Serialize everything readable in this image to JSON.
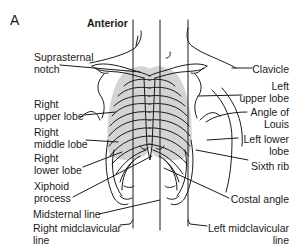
{
  "figure": {
    "panel_letter": "A",
    "view_title": "Anterior",
    "colors": {
      "line": "#1a1a1a",
      "lung_fill": "#d4d4d4",
      "background": "#ffffff"
    }
  },
  "labels_left": [
    {
      "id": "suprasternal-notch",
      "line1": "Suprasternal",
      "line2": "notch"
    },
    {
      "id": "right-upper-lobe",
      "line1": "Right",
      "line2": "upper lobe"
    },
    {
      "id": "right-middle-lobe",
      "line1": "Right",
      "line2": "middle lobe"
    },
    {
      "id": "right-lower-lobe",
      "line1": "Right",
      "line2": "lower lobe"
    },
    {
      "id": "xiphoid-process",
      "line1": "Xiphoid",
      "line2": "process"
    },
    {
      "id": "midsternal-line",
      "line1": "Midsternal line",
      "line2": ""
    },
    {
      "id": "right-midclavicular-line",
      "line1": "Right midclavicular",
      "line2": "line"
    }
  ],
  "labels_right": [
    {
      "id": "clavicle",
      "line1": "Clavicle",
      "line2": ""
    },
    {
      "id": "left-upper-lobe",
      "line1": "Left",
      "line2": "upper lobe"
    },
    {
      "id": "angle-of-louis",
      "line1": "Angle of",
      "line2": "Louis"
    },
    {
      "id": "left-lower-lobe",
      "line1": "Left lower",
      "line2": "lobe"
    },
    {
      "id": "sixth-rib",
      "line1": "Sixth rib",
      "line2": ""
    },
    {
      "id": "costal-angle",
      "line1": "Costal angle",
      "line2": ""
    },
    {
      "id": "left-midclavicular-line",
      "line1": "Left midclavicular",
      "line2": "line"
    }
  ]
}
